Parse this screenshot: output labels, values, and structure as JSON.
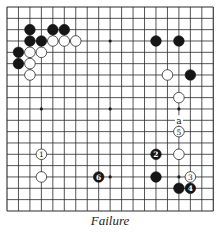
{
  "diagram": {
    "type": "go-board",
    "size": 19,
    "caption": "Failure",
    "geometry": {
      "left": 7,
      "top": 7,
      "dx": 11.46,
      "dy": 11.33,
      "stone_radius": 5.3
    },
    "star_points": [
      [
        3,
        3
      ],
      [
        9,
        3
      ],
      [
        15,
        3
      ],
      [
        3,
        9
      ],
      [
        9,
        9
      ],
      [
        15,
        9
      ],
      [
        3,
        15
      ],
      [
        9,
        15
      ],
      [
        15,
        15
      ]
    ],
    "stones": {
      "black": [
        [
          2,
          2
        ],
        [
          4,
          2
        ],
        [
          5,
          2
        ],
        [
          2,
          3
        ],
        [
          3,
          3
        ],
        [
          1,
          4
        ],
        [
          1,
          5
        ],
        [
          13,
          3
        ],
        [
          15,
          3
        ],
        [
          16,
          6
        ],
        [
          13,
          15
        ],
        [
          15,
          16
        ]
      ],
      "white": [
        [
          4,
          3
        ],
        [
          5,
          3
        ],
        [
          6,
          3
        ],
        [
          2,
          4
        ],
        [
          3,
          4
        ],
        [
          2,
          5
        ],
        [
          2,
          6
        ],
        [
          14,
          6
        ],
        [
          15,
          8
        ],
        [
          15,
          13
        ],
        [
          3,
          15
        ]
      ]
    },
    "numbered_moves": [
      {
        "n": "1",
        "color": "white",
        "pos": [
          3,
          13
        ]
      },
      {
        "n": "2",
        "color": "black",
        "pos": [
          13,
          13
        ]
      },
      {
        "n": "3",
        "color": "white",
        "pos": [
          16,
          15
        ]
      },
      {
        "n": "4",
        "color": "black",
        "pos": [
          16,
          16
        ]
      },
      {
        "n": "5",
        "color": "white",
        "pos": [
          15,
          11
        ]
      },
      {
        "n": "6",
        "color": "black",
        "pos": [
          8,
          15
        ]
      }
    ],
    "labels": [
      {
        "text": "a",
        "pos": [
          15,
          10
        ]
      }
    ],
    "colors": {
      "line": "#2a2a2a",
      "black_stone": "#161616",
      "white_stone": "#ffffff",
      "background": "#ffffff"
    }
  }
}
